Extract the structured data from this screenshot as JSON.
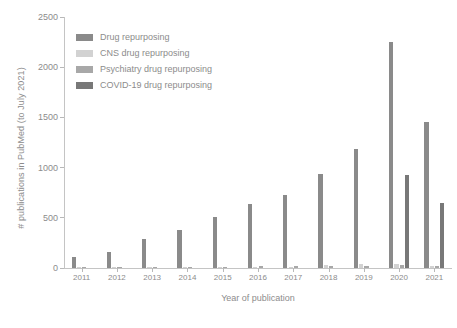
{
  "chart_data": {
    "type": "bar",
    "title": "",
    "xlabel": "Year of publication",
    "ylabel": "# publications in PubMed (to July 2021)",
    "categories": [
      "2011",
      "2012",
      "2013",
      "2014",
      "2015",
      "2016",
      "2017",
      "2018",
      "2019",
      "2020",
      "2021"
    ],
    "ylim": [
      0,
      2500
    ],
    "yticks": [
      0,
      500,
      1000,
      1500,
      2000,
      2500
    ],
    "grid": false,
    "legend_position": "upper left",
    "series": [
      {
        "name": "Drug repurposing",
        "color": "#8a8a8a",
        "values": [
          108,
          160,
          285,
          380,
          510,
          640,
          725,
          940,
          1190,
          2250,
          1450
        ]
      },
      {
        "name": "CNS drug repurposing",
        "color": "#d2d2d2",
        "values": [
          2,
          2,
          3,
          4,
          6,
          9,
          12,
          28,
          36,
          42,
          18
        ]
      },
      {
        "name": "Psychiatry drug repurposing",
        "color": "#a8a8a8",
        "values": [
          1,
          1,
          2,
          3,
          4,
          16,
          18,
          22,
          24,
          30,
          22
        ]
      },
      {
        "name": "COVID-19 drug repurposing",
        "color": "#787878",
        "values": [
          0,
          0,
          0,
          0,
          0,
          0,
          0,
          0,
          0,
          930,
          650
        ]
      }
    ]
  }
}
